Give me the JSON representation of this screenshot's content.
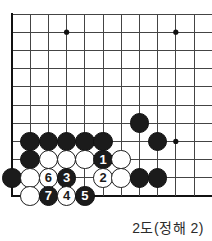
{
  "figure": {
    "kind": "go-board-diagram",
    "caption": "2도(정해 2)",
    "board": {
      "origin_x": 12,
      "origin_y": 14,
      "spacing": 18.2,
      "cols": 11,
      "rows": 11,
      "edges": [
        "left",
        "bottom"
      ],
      "line_color": "#444444",
      "thick_line_color": "#111111",
      "background": "#ffffff",
      "star_points": [
        {
          "col": 3,
          "row": 1
        },
        {
          "col": 9,
          "row": 1
        },
        {
          "col": 9,
          "row": 7
        }
      ]
    },
    "stones": [
      {
        "id": "b-left-edge-r9",
        "color": "black",
        "col": 0,
        "row": 9,
        "label": ""
      },
      {
        "id": "b-r7-c1",
        "color": "black",
        "col": 1,
        "row": 7,
        "label": ""
      },
      {
        "id": "b-r7-c2",
        "color": "black",
        "col": 2,
        "row": 7,
        "label": ""
      },
      {
        "id": "b-r7-c3",
        "color": "black",
        "col": 3,
        "row": 7,
        "label": ""
      },
      {
        "id": "b-r7-c4",
        "color": "black",
        "col": 4,
        "row": 7,
        "label": ""
      },
      {
        "id": "b-r7-c5",
        "color": "black",
        "col": 5,
        "row": 7,
        "label": ""
      },
      {
        "id": "b-r8-c1",
        "color": "black",
        "col": 1,
        "row": 8,
        "label": ""
      },
      {
        "id": "w-r8-c2",
        "color": "white",
        "col": 2,
        "row": 8,
        "label": ""
      },
      {
        "id": "w-r8-c3",
        "color": "white",
        "col": 3,
        "row": 8,
        "label": ""
      },
      {
        "id": "w-r8-c4",
        "color": "white",
        "col": 4,
        "row": 8,
        "label": ""
      },
      {
        "id": "b-move-1",
        "color": "black",
        "col": 5,
        "row": 8,
        "label": "1"
      },
      {
        "id": "w-r8-c6",
        "color": "white",
        "col": 6,
        "row": 8,
        "label": ""
      },
      {
        "id": "w-r9-c1",
        "color": "white",
        "col": 1,
        "row": 9,
        "label": ""
      },
      {
        "id": "w-move-6",
        "color": "white",
        "col": 2,
        "row": 9,
        "label": "6"
      },
      {
        "id": "b-move-3",
        "color": "black",
        "col": 3,
        "row": 9,
        "label": "3"
      },
      {
        "id": "w-move-2",
        "color": "white",
        "col": 5,
        "row": 9,
        "label": "2"
      },
      {
        "id": "w-r9-c6",
        "color": "white",
        "col": 6,
        "row": 9,
        "label": ""
      },
      {
        "id": "b-r9-c7",
        "color": "black",
        "col": 7,
        "row": 9,
        "label": ""
      },
      {
        "id": "b-r9-c8",
        "color": "black",
        "col": 8,
        "row": 9,
        "label": ""
      },
      {
        "id": "w-r10-c1",
        "color": "white",
        "col": 1,
        "row": 10,
        "label": ""
      },
      {
        "id": "b-move-7",
        "color": "black",
        "col": 2,
        "row": 10,
        "label": "7"
      },
      {
        "id": "w-move-4",
        "color": "white",
        "col": 3,
        "row": 10,
        "label": "4"
      },
      {
        "id": "b-move-5",
        "color": "black",
        "col": 4,
        "row": 10,
        "label": "5"
      },
      {
        "id": "b-r6-c7",
        "color": "black",
        "col": 7,
        "row": 6,
        "label": ""
      },
      {
        "id": "b-r7-c8",
        "color": "black",
        "col": 8,
        "row": 7,
        "label": ""
      }
    ]
  }
}
